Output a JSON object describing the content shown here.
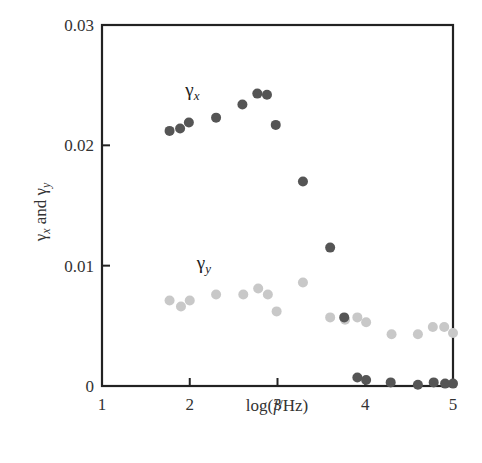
{
  "chart_data": {
    "type": "scatter",
    "title": "",
    "xlabel": "log(f/Hz)",
    "ylabel": "γx and γy",
    "xlim": [
      1,
      5
    ],
    "ylim": [
      0,
      0.03
    ],
    "x_ticks": [
      1,
      2,
      3,
      4,
      5
    ],
    "x_tick_labels": [
      "1",
      "2",
      "3",
      "4",
      "5"
    ],
    "y_ticks": [
      0,
      0.01,
      0.02,
      0.03
    ],
    "y_tick_labels": [
      "0",
      "0.01",
      "0.02",
      "0.03"
    ],
    "grid": false,
    "legend": "inline labels",
    "series": [
      {
        "name": "γx",
        "label_main": "γ",
        "label_sub": "x",
        "color": "#555555",
        "label_pos": [
          1.95,
          0.0241
        ],
        "x": [
          1.77,
          1.89,
          1.99,
          2.3,
          2.6,
          2.77,
          2.88,
          2.98,
          3.29,
          3.6,
          3.76,
          3.91,
          4.01,
          4.29,
          4.6,
          4.78,
          4.91,
          5.0
        ],
        "y": [
          0.0212,
          0.0214,
          0.0219,
          0.0223,
          0.0234,
          0.0243,
          0.0242,
          0.0217,
          0.017,
          0.0115,
          0.0057,
          0.0007,
          0.0005,
          0.0003,
          0.0001,
          0.0003,
          0.0002,
          0.0002
        ]
      },
      {
        "name": "γy",
        "label_main": "γ",
        "label_sub": "y",
        "color": "#c8c8c8",
        "label_pos": [
          2.08,
          0.0097
        ],
        "x": [
          1.77,
          1.9,
          2.0,
          2.3,
          2.61,
          2.78,
          2.89,
          2.99,
          3.29,
          3.6,
          3.77,
          3.91,
          4.01,
          4.3,
          4.6,
          4.77,
          4.9,
          5.0
        ],
        "y": [
          0.0071,
          0.0066,
          0.0071,
          0.0076,
          0.0076,
          0.0081,
          0.0076,
          0.0062,
          0.0086,
          0.0057,
          0.0055,
          0.0057,
          0.0053,
          0.0043,
          0.0043,
          0.0049,
          0.0049,
          0.0044
        ]
      }
    ]
  },
  "axes": {
    "xlabel_prefix": "log(",
    "xlabel_italic": "f",
    "xlabel_suffix": "/Hz)",
    "ylabel_g1": "γ",
    "ylabel_s1": "x",
    "ylabel_and": " and ",
    "ylabel_g2": "γ",
    "ylabel_s2": "y"
  }
}
